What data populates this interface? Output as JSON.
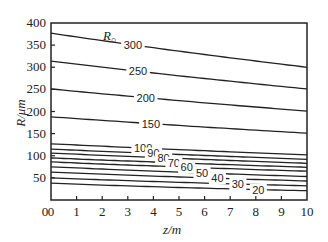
{
  "chart_data": {
    "type": "line",
    "title": "",
    "xlabel": "z/m",
    "ylabel": "R/μm",
    "xlim": [
      0,
      10
    ],
    "ylim": [
      0,
      400
    ],
    "xticks": [
      0,
      1,
      2,
      3,
      4,
      5,
      6,
      7,
      8,
      9,
      10
    ],
    "yticks": [
      50,
      100,
      150,
      200,
      250,
      300,
      350,
      400
    ],
    "xtick_labels": [
      "0",
      "1",
      "2",
      "3",
      "4",
      "5",
      "6",
      "7",
      "8",
      "9",
      "10"
    ],
    "ytick_labels": [
      "50",
      "100",
      "150",
      "200",
      "250",
      "300",
      "350",
      "400"
    ],
    "grid": false,
    "legend": "none; curves labeled inline by R₀ value",
    "series_parameter_label": "R₀",
    "x": [
      0,
      10
    ],
    "series": [
      {
        "name": "300",
        "values": [
          377,
          300
        ],
        "label_pos": [
          3.2,
          345
        ]
      },
      {
        "name": "250",
        "values": [
          314,
          251
        ],
        "label_pos": [
          3.4,
          287
        ]
      },
      {
        "name": "200",
        "values": [
          251,
          201
        ],
        "label_pos": [
          3.7,
          225
        ]
      },
      {
        "name": "150",
        "values": [
          188,
          151
        ],
        "label_pos": [
          3.9,
          165
        ]
      },
      {
        "name": "100",
        "values": [
          127,
          102
        ],
        "label_pos": [
          3.6,
          118
        ]
      },
      {
        "name": "90",
        "values": [
          115,
          92
        ],
        "label_pos": [
          4.0,
          103
        ]
      },
      {
        "name": "80",
        "values": [
          106,
          83
        ],
        "label_pos": [
          4.4,
          94
        ]
      },
      {
        "name": "70",
        "values": [
          95,
          74
        ],
        "label_pos": [
          4.8,
          85
        ]
      },
      {
        "name": "60",
        "values": [
          86,
          65
        ],
        "label_pos": [
          5.3,
          75
        ]
      },
      {
        "name": "50",
        "values": [
          75,
          53
        ],
        "label_pos": [
          5.9,
          63
        ]
      },
      {
        "name": "40",
        "values": [
          63,
          43
        ],
        "label_pos": [
          6.5,
          52
        ]
      },
      {
        "name": "30",
        "values": [
          50,
          32
        ],
        "label_pos": [
          7.3,
          40
        ]
      },
      {
        "name": "20",
        "values": [
          38,
          21
        ],
        "label_pos": [
          8.1,
          27
        ]
      }
    ]
  },
  "labels": {
    "x_axis_title": "z/m",
    "y_axis_title": "R/μm",
    "series_parameter": "R₀"
  }
}
